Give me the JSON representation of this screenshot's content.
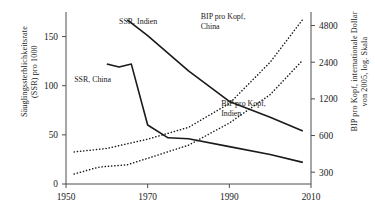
{
  "chart_data": {
    "type": "line",
    "title": "",
    "xlabel": "",
    "ylabel_left": "Säuglingssterblichkeitsrate (SSR) pro 1000",
    "ylabel_right": "BIP pro Kopf, internationale Dollar von 2005, log. Skala",
    "xlim": [
      1950,
      2010
    ],
    "xticks": [
      1950,
      1970,
      1990,
      2010
    ],
    "xticklabels": [
      "1950",
      "1970",
      "1990",
      "2010"
    ],
    "ylim_left": [
      0,
      175
    ],
    "yticks_left": [
      0,
      50,
      100,
      150
    ],
    "yticklabels_left": [
      "0",
      "50",
      "100",
      "150"
    ],
    "ylim_right": [
      240,
      6200
    ],
    "yticks_right": [
      300,
      600,
      1200,
      2400,
      4800
    ],
    "yticklabels_right": [
      "300",
      "600",
      "1200",
      "2400",
      "4800"
    ],
    "right_axis_scale": "log",
    "grid": false,
    "legend_position": "inline-annotations",
    "series": [
      {
        "name": "SSR, Indien",
        "axis": "left",
        "style": "solid",
        "x": [
          1965,
          1970,
          1980,
          1990,
          2000,
          2008
        ],
        "values": [
          167,
          151,
          115,
          84,
          68,
          54
        ]
      },
      {
        "name": "SSR, China",
        "axis": "left",
        "style": "solid",
        "x": [
          1960,
          1963,
          1966,
          1970,
          1975,
          1980,
          1990,
          2000,
          2008
        ],
        "values": [
          122,
          119,
          122,
          60,
          47,
          46,
          38,
          30,
          22
        ]
      },
      {
        "name": "BIP pro Kopf, China",
        "axis": "right",
        "style": "dotted",
        "x": [
          1952,
          1960,
          1970,
          1980,
          1990,
          2000,
          2008
        ],
        "values": [
          440,
          470,
          560,
          700,
          1100,
          2400,
          5400
        ]
      },
      {
        "name": "BIP pro Kopf, Indien",
        "axis": "right",
        "style": "dotted",
        "x": [
          1952,
          1958,
          1965,
          1970,
          1980,
          1990,
          2000,
          2008
        ],
        "values": [
          290,
          330,
          345,
          390,
          500,
          760,
          1300,
          2500
        ]
      }
    ],
    "annotations": [
      {
        "text": "SSR, Indien",
        "x": 1963,
        "y": 163,
        "name": "ssr-indien"
      },
      {
        "text": "SSR, China",
        "x": 1952,
        "y": 104,
        "name": "ssr-china"
      },
      {
        "text": "BIP pro Kopf,",
        "x": 1983,
        "y": 168,
        "name": "bip-china-line1"
      },
      {
        "text": "China",
        "x": 1983,
        "y": 158,
        "name": "bip-china-line2"
      },
      {
        "text": "BIP pro Kopf,",
        "x": 1988,
        "y": 79,
        "name": "bip-indien-line1"
      },
      {
        "text": "Indien",
        "x": 1988,
        "y": 69,
        "name": "bip-indien-line2"
      }
    ]
  },
  "axis_titles": {
    "left_line1": "Säuglingssterblichkeitsrate",
    "left_line2": "(SSR) pro 1000",
    "right_line1": "BIP pro Kopf, internationale Dollar",
    "right_line2": "von 2005, log. Skala"
  },
  "colors": {
    "line": "#1a1a1a",
    "axis": "#4d4d4d",
    "background": "#ffffff"
  }
}
